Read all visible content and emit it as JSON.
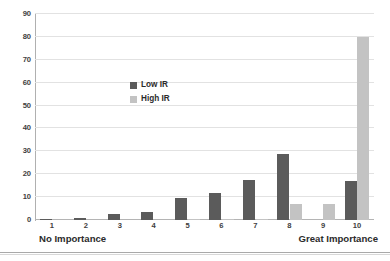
{
  "chart_data": {
    "type": "bar",
    "title": "",
    "subtitle": "",
    "xlabel": "",
    "ylabel": "",
    "categories": [
      "1",
      "2",
      "3",
      "4",
      "5",
      "6",
      "7",
      "8",
      "9",
      "10"
    ],
    "series": [
      {
        "name": "Low IR",
        "color": "#5b5b5b",
        "values": [
          0.5,
          1,
          2.5,
          3.5,
          9.5,
          12,
          17.5,
          29,
          0,
          17
        ]
      },
      {
        "name": "High IR",
        "color": "#c3c3c3",
        "values": [
          0,
          0,
          0,
          0,
          0.5,
          0.5,
          0.5,
          7,
          7,
          80
        ]
      }
    ],
    "ylim": [
      0,
      90
    ],
    "yticks": [
      0,
      10,
      20,
      30,
      40,
      50,
      60,
      70,
      80,
      90
    ],
    "ytick_labels": [
      "0",
      "10",
      "20",
      "30",
      "40",
      "50",
      "60",
      "70",
      "80",
      "90"
    ],
    "grid": "horizontal",
    "legend_position": "inside-upper-center",
    "annotations": [
      {
        "name": "no-importance",
        "text": "No Importance",
        "position": "x-axis-left-end"
      },
      {
        "name": "great-importance",
        "text": "Great Importance",
        "position": "x-axis-right-end"
      }
    ]
  },
  "legend": {
    "entries": [
      {
        "label": "Low IR",
        "color": "#5b5b5b"
      },
      {
        "label": "High IR",
        "color": "#c3c3c3"
      }
    ]
  },
  "colors": {
    "low_ir": "#5b5b5b",
    "high_ir": "#c3c3c3",
    "gridline": "#e2e2e2",
    "axis": "#b0b0b0",
    "text": "#2b2b2b",
    "background": "#ffffff"
  }
}
